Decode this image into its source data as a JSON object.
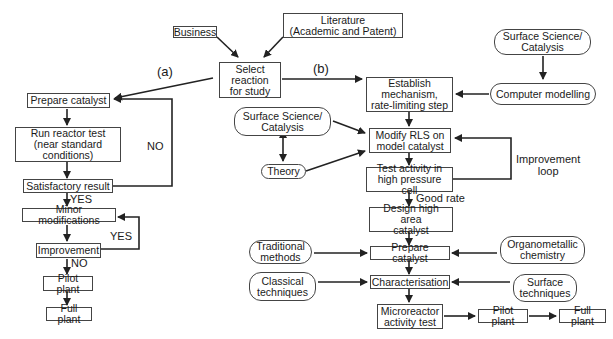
{
  "diagram": {
    "top": {
      "business": "Business",
      "literature": "Literature\n(Academic and Patent)",
      "select_reaction": "Select\nreaction\nfor study"
    },
    "branch_labels": {
      "a": "(a)",
      "b": "(b)"
    },
    "path_a": {
      "prepare_catalyst": "Prepare catalyst",
      "run_reactor_test": "Run reactor test\n(near standard\nconditions)",
      "satisfactory_result": "Satisfactory result",
      "minor_modifications": "Minor modifications",
      "improvement": "Improvement",
      "pilot_plant": "Pilot plant",
      "full_plant": "Full plant",
      "labels": {
        "no_loop": "NO",
        "yes_satisfactory": "YES",
        "yes_improvement": "YES",
        "no_improvement": "NO"
      }
    },
    "path_b": {
      "surface_science_top": "Surface Science/\nCatalysis",
      "computer_modelling": "Computer modelling",
      "establish_mechanism": "Establish\nmechanism,\nrate-limiting step",
      "surface_science_mid": "Surface Science/\nCatalysis",
      "theory": "Theory",
      "modify_rls": "Modify RLS on\nmodel catalyst",
      "test_activity": "Test activity in\nhigh pressure cell",
      "improvement_loop": "Improvement\nloop",
      "good_rate": "Good rate",
      "design_high_area": "Design high area\ncatalyst",
      "traditional_methods": "Traditional\nmethods",
      "prepare_catalyst": "Prepare catalyst",
      "organometallic": "Organometallic\nchemistry",
      "classical_techniques": "Classical\ntechniques",
      "characterisation": "Characterisation",
      "surface_techniques": "Surface\ntechniques",
      "microreactor": "Microreactor\nactivity test",
      "pilot_plant": "Pilot plant",
      "full_plant": "Full plant"
    }
  }
}
